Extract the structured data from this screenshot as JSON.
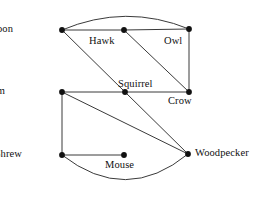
{
  "figure": {
    "type": "undirected-graph",
    "title": "",
    "background_color": "#ffffff",
    "edge_color": "#3a3a3a",
    "node_color": "#111111",
    "width": 263,
    "height": 203
  },
  "nodes": [
    {
      "id": "raccoon",
      "label": "Raccoon",
      "x": 62,
      "y": 30,
      "label_x": 13,
      "label_y": 24,
      "label_align": "right"
    },
    {
      "id": "hawk",
      "label": "Hawk",
      "x": 124,
      "y": 30,
      "label_x": 89,
      "label_y": 36,
      "label_align": "left"
    },
    {
      "id": "owl",
      "label": "Owl",
      "x": 189,
      "y": 29,
      "label_x": 164,
      "label_y": 36,
      "label_align": "left"
    },
    {
      "id": "opossum",
      "label": "Opossum",
      "x": 62,
      "y": 92,
      "label_x": 5,
      "label_y": 86,
      "label_align": "right"
    },
    {
      "id": "squirrel",
      "label": "Squirrel",
      "x": 125,
      "y": 92,
      "label_x": 118,
      "label_y": 79,
      "label_align": "left"
    },
    {
      "id": "crow",
      "label": "Crow",
      "x": 189,
      "y": 92,
      "label_x": 168,
      "label_y": 96,
      "label_align": "left"
    },
    {
      "id": "shrew",
      "label": "Shrew",
      "x": 62,
      "y": 155,
      "label_x": 22,
      "label_y": 149,
      "label_align": "right"
    },
    {
      "id": "mouse",
      "label": "Mouse",
      "x": 124,
      "y": 155,
      "label_x": 105,
      "label_y": 160,
      "label_align": "left"
    },
    {
      "id": "woodpecker",
      "label": "Woodpecker",
      "x": 188,
      "y": 154,
      "label_x": 195,
      "label_y": 148,
      "label_align": "left"
    }
  ],
  "edges": [
    {
      "id": "raccoon-owl",
      "from": "Raccoon",
      "to": "Owl",
      "shape": "arc",
      "path": "M 62 30 Q 126 3 189 29"
    },
    {
      "id": "raccoon-hawk",
      "from": "Raccoon",
      "to": "Hawk",
      "shape": "straight",
      "path": "M 62 30 L 124 30"
    },
    {
      "id": "hawk-owl",
      "from": "Hawk",
      "to": "Owl",
      "shape": "straight",
      "path": "M 124 30 L 189 29"
    },
    {
      "id": "raccoon-squirrel",
      "from": "Raccoon",
      "to": "Squirrel",
      "shape": "straight",
      "path": "M 62 30 L 125 92"
    },
    {
      "id": "squirrel-woodpecker",
      "from": "Squirrel",
      "to": "Woodpecker",
      "shape": "straight",
      "path": "M 125 92 L 188 154"
    },
    {
      "id": "hawk-crow",
      "from": "Hawk",
      "to": "Crow",
      "shape": "straight",
      "path": "M 124 30 L 189 92"
    },
    {
      "id": "owl-crow",
      "from": "Owl",
      "to": "Crow",
      "shape": "straight",
      "path": "M 189 29 L 189 92"
    },
    {
      "id": "opossum-squirrel",
      "from": "Opossum",
      "to": "Squirrel",
      "shape": "straight",
      "path": "M 62 92 L 125 92"
    },
    {
      "id": "squirrel-crow",
      "from": "Squirrel",
      "to": "Crow",
      "shape": "straight",
      "path": "M 125 92 L 189 92"
    },
    {
      "id": "opossum-shrew",
      "from": "Opossum",
      "to": "Shrew",
      "shape": "straight",
      "path": "M 62 92 L 62 155"
    },
    {
      "id": "opossum-woodpecker",
      "from": "Opossum",
      "to": "Woodpecker",
      "shape": "straight",
      "path": "M 62 92 L 188 154"
    },
    {
      "id": "shrew-mouse",
      "from": "Shrew",
      "to": "Mouse",
      "shape": "straight",
      "path": "M 62 155 L 124 155"
    },
    {
      "id": "shrew-woodpecker",
      "from": "Shrew",
      "to": "Woodpecker",
      "shape": "arc",
      "path": "M 62 155 Q 126 205 188 154"
    }
  ],
  "chart_data": {
    "type": "graph",
    "title": "",
    "node_labels": [
      "Raccoon",
      "Hawk",
      "Owl",
      "Opossum",
      "Squirrel",
      "Crow",
      "Shrew",
      "Mouse",
      "Woodpecker"
    ],
    "edge_list": [
      [
        "Raccoon",
        "Owl"
      ],
      [
        "Raccoon",
        "Hawk"
      ],
      [
        "Hawk",
        "Owl"
      ],
      [
        "Raccoon",
        "Squirrel"
      ],
      [
        "Squirrel",
        "Woodpecker"
      ],
      [
        "Hawk",
        "Crow"
      ],
      [
        "Owl",
        "Crow"
      ],
      [
        "Opossum",
        "Squirrel"
      ],
      [
        "Squirrel",
        "Crow"
      ],
      [
        "Opossum",
        "Shrew"
      ],
      [
        "Opossum",
        "Woodpecker"
      ],
      [
        "Shrew",
        "Mouse"
      ],
      [
        "Shrew",
        "Woodpecker"
      ]
    ],
    "degrees": {
      "Raccoon": 3,
      "Hawk": 3,
      "Owl": 3,
      "Opossum": 3,
      "Squirrel": 4,
      "Crow": 3,
      "Shrew": 3,
      "Mouse": 1,
      "Woodpecker": 3
    },
    "node_count": 9,
    "edge_count": 13,
    "directed": false,
    "legend": [],
    "grid": false
  }
}
